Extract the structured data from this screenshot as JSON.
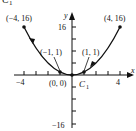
{
  "figure": {
    "title_label": "C",
    "title_subscript": "1",
    "curve_label": "C",
    "curve_subscript": "1",
    "x_axis_label": "x",
    "y_axis_label": "y",
    "x_ticks": {
      "neg": "−4",
      "pos": "4"
    },
    "y_ticks": {
      "pos": "16",
      "neg": "−16"
    },
    "points": [
      {
        "label": "(−4, 16)",
        "x": -4,
        "y": 16
      },
      {
        "label": "(−1, 1)",
        "x": -1,
        "y": 1
      },
      {
        "label": "(0, 0)",
        "x": 0,
        "y": 0
      },
      {
        "label": "(1, 1)",
        "x": 1,
        "y": 1
      },
      {
        "label": "(4, 16)",
        "x": 4,
        "y": 16
      }
    ],
    "curve": "y = x^2",
    "domain": [
      -4,
      4
    ],
    "colors": {
      "ink": "#111111",
      "background": "#ffffff"
    }
  }
}
